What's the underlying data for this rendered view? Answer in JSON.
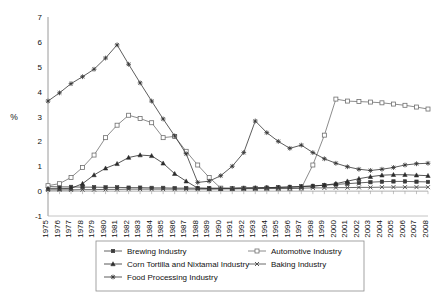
{
  "chart_data": {
    "type": "line",
    "title": "",
    "xlabel": "",
    "ylabel": "%",
    "ylim": [
      -1,
      7
    ],
    "yticks": [
      -1,
      0,
      1,
      2,
      3,
      4,
      5,
      6,
      7
    ],
    "grid": false,
    "legend_position": "bottom",
    "x": [
      1975,
      1976,
      1977,
      1978,
      1979,
      1980,
      1981,
      1982,
      1983,
      1984,
      1985,
      1986,
      1987,
      1988,
      1989,
      1990,
      1991,
      1992,
      1993,
      1994,
      1995,
      1996,
      1997,
      1998,
      1999,
      2000,
      2001,
      2002,
      2003,
      2004,
      2005,
      2006,
      2007,
      2008
    ],
    "series": [
      {
        "name": "Brewing Industry",
        "marker": "filled-square",
        "color": "#3a3a3a",
        "values": [
          0.18,
          0.17,
          0.17,
          0.16,
          0.16,
          0.15,
          0.15,
          0.14,
          0.14,
          0.13,
          0.13,
          0.12,
          0.12,
          0.12,
          0.12,
          0.12,
          0.12,
          0.13,
          0.13,
          0.14,
          0.15,
          0.17,
          0.19,
          0.21,
          0.24,
          0.27,
          0.3,
          0.33,
          0.36,
          0.38,
          0.39,
          0.39,
          0.38,
          0.37
        ]
      },
      {
        "name": "Automotive Industry",
        "marker": "open-square",
        "color": "#6f6f6f",
        "values": [
          0.22,
          0.3,
          0.55,
          0.95,
          1.45,
          2.15,
          2.65,
          3.05,
          2.92,
          2.75,
          2.15,
          2.2,
          1.6,
          1.05,
          0.55,
          0.12,
          0.1,
          0.1,
          0.1,
          0.1,
          0.1,
          0.1,
          0.12,
          1.05,
          2.25,
          3.7,
          3.62,
          3.6,
          3.58,
          3.55,
          3.5,
          3.45,
          3.38,
          3.3
        ]
      },
      {
        "name": "Corn Tortilla and Nixtamal Industry",
        "marker": "filled-triangle",
        "color": "#2b2b2b",
        "values": [
          0.1,
          0.1,
          0.11,
          0.3,
          0.65,
          0.92,
          1.1,
          1.35,
          1.45,
          1.42,
          1.12,
          0.7,
          0.4,
          0.12,
          0.1,
          0.1,
          0.11,
          0.12,
          0.13,
          0.14,
          0.15,
          0.16,
          0.18,
          0.2,
          0.24,
          0.3,
          0.4,
          0.5,
          0.58,
          0.64,
          0.66,
          0.66,
          0.64,
          0.62
        ]
      },
      {
        "name": "Baking Industry",
        "marker": "filled-x",
        "color": "#454545",
        "values": [
          0.05,
          0.05,
          0.05,
          0.06,
          0.06,
          0.07,
          0.07,
          0.08,
          0.08,
          0.08,
          0.08,
          0.08,
          0.08,
          0.08,
          0.08,
          0.09,
          0.09,
          0.1,
          0.1,
          0.11,
          0.11,
          0.12,
          0.12,
          0.13,
          0.13,
          0.14,
          0.14,
          0.15,
          0.15,
          0.16,
          0.16,
          0.16,
          0.16,
          0.16
        ]
      },
      {
        "name": "Food Processing Industry",
        "marker": "filled-star",
        "color": "#333333",
        "values": [
          3.62,
          3.95,
          4.32,
          4.6,
          4.9,
          5.35,
          5.88,
          5.1,
          4.35,
          3.62,
          2.9,
          2.22,
          1.5,
          0.35,
          0.4,
          0.62,
          1.0,
          1.55,
          2.82,
          2.35,
          2.0,
          1.72,
          1.85,
          1.55,
          1.3,
          1.12,
          0.98,
          0.88,
          0.83,
          0.88,
          0.95,
          1.05,
          1.1,
          1.12
        ]
      }
    ]
  }
}
